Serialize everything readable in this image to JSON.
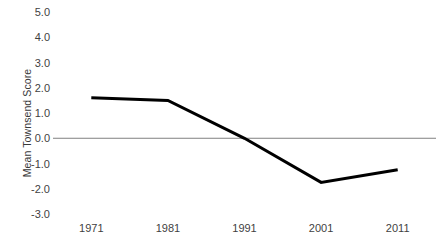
{
  "chart_data": {
    "type": "line",
    "title": "",
    "subtitle": "",
    "xlabel": "",
    "ylabel": "Mean Townsend Score",
    "categories": [
      "1971",
      "1981",
      "1991",
      "2001",
      "2011"
    ],
    "x": [
      1971,
      1981,
      1991,
      2001,
      2011
    ],
    "values": [
      1.6,
      1.5,
      0.0,
      -1.75,
      -1.25
    ],
    "series": [
      {
        "name": "Mean Townsend Score",
        "values": [
          1.6,
          1.5,
          0.0,
          -1.75,
          -1.25
        ],
        "color": "#000000",
        "line_width": 3
      }
    ],
    "ylim": [
      -3.0,
      5.0
    ],
    "y_ticks": [
      5.0,
      4.0,
      3.0,
      2.0,
      1.0,
      0.0,
      -1.0,
      -2.0,
      -3.0
    ],
    "y_tick_labels": [
      "5.0",
      "4.0",
      "3.0",
      "2.0",
      "1.0",
      "0.0",
      "-1.0",
      "-2.0",
      "-3.0"
    ],
    "x_tick_labels": [
      "1971",
      "1981",
      "1991",
      "2001",
      "2011"
    ],
    "grid": false,
    "legend": false,
    "legend_position": "none",
    "zero_line": true,
    "zero_line_color": "#808080",
    "background_color": "#ffffff",
    "annotations": []
  },
  "axis": {
    "y_title": "Mean Townsend Score",
    "y_labels": {
      "t0": "5.0",
      "t1": "4.0",
      "t2": "3.0",
      "t3": "2.0",
      "t4": "1.0",
      "t5": "0.0",
      "t6": "-1.0",
      "t7": "-2.0",
      "t8": "-3.0"
    },
    "x_labels": {
      "t0": "1971",
      "t1": "1981",
      "t2": "1991",
      "t3": "2001",
      "t4": "2011"
    }
  }
}
